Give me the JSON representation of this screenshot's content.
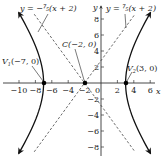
{
  "chart_data": {
    "type": "line",
    "title": "",
    "xlabel": "x",
    "ylabel": "y",
    "xlim": [
      -12,
      7
    ],
    "ylim": [
      -9.5,
      10
    ],
    "grid": false,
    "legend": null,
    "x_ticks": [
      -10,
      -8,
      -6,
      -4,
      -2,
      0,
      2,
      4,
      6
    ],
    "x_tick_labels": [
      "−10",
      "−8",
      "−6",
      "−4",
      "−2",
      "0",
      "2",
      "4",
      "6"
    ],
    "y_ticks": [
      8,
      6,
      4,
      2,
      -2,
      -4,
      -6,
      -8
    ],
    "y_tick_labels": [
      "8",
      "6",
      "4",
      "2",
      "−2",
      "−4",
      "−6",
      "−8"
    ],
    "series": [
      {
        "name": "hyperbola",
        "equation": "(x+2)^2/25 - y^2/49 = 1",
        "style": "solid",
        "center": [
          -2,
          0
        ],
        "a": 5,
        "b": 7
      },
      {
        "name": "asymptote_positive",
        "equation": "y = (7/5)(x + 2)",
        "style": "dashed"
      },
      {
        "name": "asymptote_negative",
        "equation": "y = -(7/5)(x + 2)",
        "style": "dashed"
      }
    ],
    "points": [
      {
        "label": "V1(−7, 0)",
        "x": -7,
        "y": 0
      },
      {
        "label": "C(−2, 0)",
        "x": -2,
        "y": 0
      },
      {
        "label": "V2(3, 0)",
        "x": 3,
        "y": 0
      }
    ],
    "annotations": [
      {
        "text": "y = −(7/5)(x + 2)",
        "target": "asymptote_negative"
      },
      {
        "text": "y = (7/5)(x + 2)",
        "target": "asymptote_positive"
      },
      {
        "text": "V1(−7, 0)",
        "target": "left vertex"
      },
      {
        "text": "C(−2, 0)",
        "target": "center"
      },
      {
        "text": "V2(3, 0)",
        "target": "right vertex"
      }
    ]
  },
  "labels": {
    "axis_x": "x",
    "axis_y": "y",
    "asym_neg_prefix": "y = −",
    "asym_neg_num": "7",
    "asym_neg_den": "5",
    "asym_neg_suffix": "(x + 2)",
    "asym_pos_prefix": "y = ",
    "asym_pos_num": "7",
    "asym_pos_den": "5",
    "asym_pos_suffix": "(x + 2)",
    "v1_prefix": "V",
    "v1_sub": "1",
    "v1_coords": "(−7, 0)",
    "center": "C(−2, 0)",
    "v2_prefix": "V",
    "v2_sub": "2",
    "v2_coords": "(3, 0)"
  },
  "colors": {
    "axis": "#333333",
    "curve": "#111111",
    "asymptote": "#444444",
    "point": "#000000"
  }
}
